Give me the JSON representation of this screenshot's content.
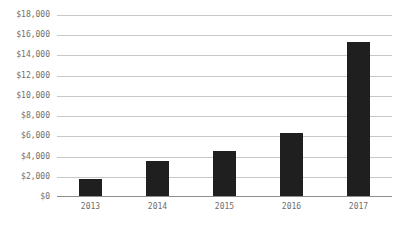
{
  "chart_data": {
    "type": "bar",
    "title": "",
    "subtitle": "",
    "xlabel": "",
    "ylabel": "",
    "categories": [
      "2013",
      "2014",
      "2015",
      "2016",
      "2017"
    ],
    "values": [
      1780,
      3550,
      4600,
      6300,
      15330
    ],
    "series": [
      {
        "name": "",
        "values": [
          1780,
          3550,
          4600,
          6300,
          15330
        ]
      }
    ],
    "ylim": [
      0,
      18000
    ],
    "ytick_step": 2000,
    "ytick_labels": [
      "$18,000",
      "$16,000",
      "$14,000",
      "$12,000",
      "$10,000",
      "$8,000",
      "$6,000",
      "$4,000",
      "$2,000",
      "$0"
    ],
    "ytick_values": [
      18000,
      16000,
      14000,
      12000,
      10000,
      8000,
      6000,
      4000,
      2000,
      0
    ],
    "xtick_labels": [
      "2013",
      "2014",
      "2015",
      "2016",
      "2017"
    ],
    "grid": true,
    "grid_axis": "y",
    "legend": false,
    "legend_position": "none",
    "annotations": [],
    "colors": {
      "bar": "#1f1f1f",
      "gridline": "#c8c8c8",
      "axis": "#8c8c8c",
      "tick_text": "#6e6e6e",
      "background": "#ffffff"
    }
  }
}
